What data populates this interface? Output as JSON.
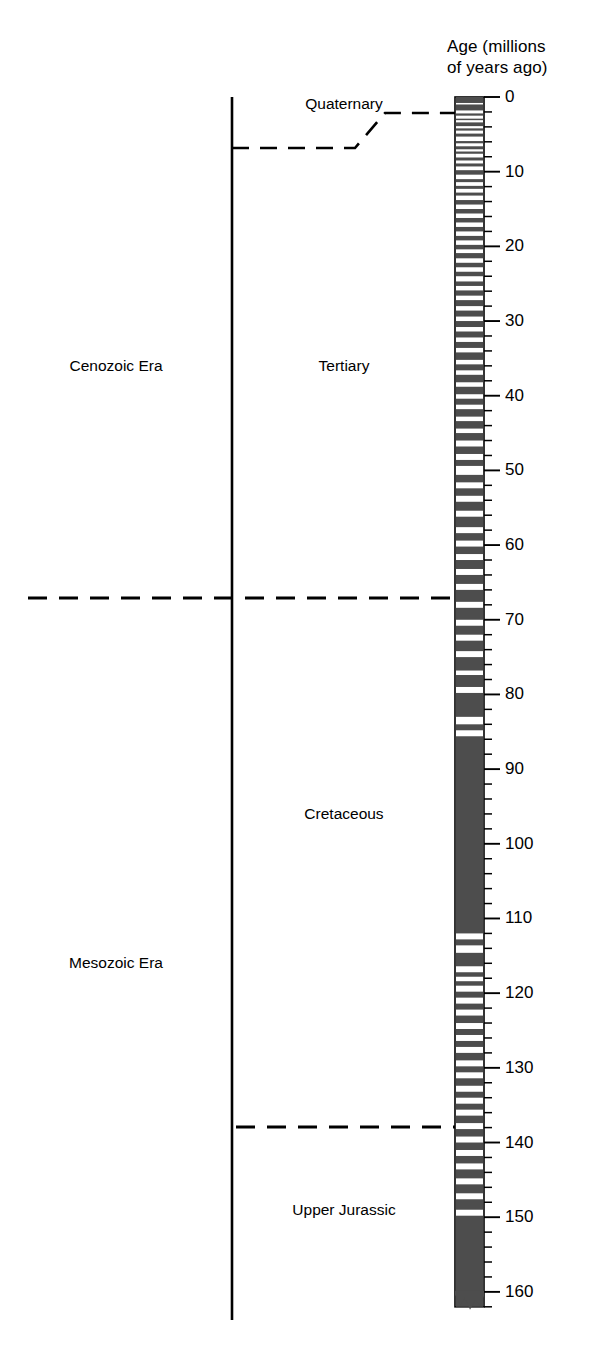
{
  "figure": {
    "axis_title": "Age (millions\nof years ago)",
    "axis_title_line1": "Age (millions",
    "axis_title_line2": "of years ago)"
  },
  "colors": {
    "normal_polarity": "#4d4d4d",
    "reversed_polarity": "#ffffff",
    "line": "#000000",
    "background": "#ffffff"
  },
  "chart_data": {
    "type": "bar",
    "subtitle": "",
    "xlabel": "",
    "ylabel": "Age (millions of years ago)",
    "ylim": [
      0,
      162
    ],
    "grid": false,
    "legend": "none",
    "orientation": "vertical-inverted",
    "axis": {
      "major_tick_interval": 10,
      "minor_tick_interval": 2,
      "tick_labels": [
        "0",
        "10",
        "20",
        "30",
        "40",
        "50",
        "60",
        "70",
        "80",
        "90",
        "100",
        "110",
        "120",
        "130",
        "140",
        "150",
        "160"
      ],
      "tick_values": [
        0,
        10,
        20,
        30,
        40,
        50,
        60,
        70,
        80,
        90,
        100,
        110,
        120,
        130,
        140,
        150,
        160
      ]
    },
    "units": "millions of years ago",
    "categories": [
      "Cenozoic Era",
      "Mesozoic Era"
    ],
    "eras": [
      {
        "label": "Cenozoic Era",
        "start": 0,
        "end": 66,
        "label_at": 36
      },
      {
        "label": "Mesozoic Era",
        "start": 66,
        "end": 162,
        "label_at": 116
      }
    ],
    "periods": [
      {
        "label": "Quaternary",
        "start": 0,
        "end": 1.8,
        "label_at": 1.0
      },
      {
        "label": "Tertiary",
        "start": 1.8,
        "end": 66,
        "label_at": 36
      },
      {
        "label": "Cretaceous",
        "start": 66,
        "end": 138,
        "label_at": 96
      },
      {
        "label": "Upper Jurassic",
        "start": 138,
        "end": 162,
        "label_at": 149
      }
    ],
    "boundaries": [
      {
        "name": "quaternary-tertiary",
        "age": 1.8,
        "style": "dashed-stepped",
        "span": "period-column"
      },
      {
        "name": "cenozoic-mesozoic",
        "age": 66,
        "style": "dashed",
        "span": "full-width"
      },
      {
        "name": "cretaceous-jurassic",
        "age": 138,
        "style": "dashed",
        "span": "period-column"
      }
    ],
    "polarity_column": {
      "description": "Magnetic polarity stripes: dark = normal polarity, white = reversed polarity",
      "top_age": 0,
      "bottom_age": 162,
      "normal_polarity_intervals": [
        [
          0.0,
          0.8
        ],
        [
          1.0,
          1.8
        ],
        [
          2.2,
          2.5
        ],
        [
          2.9,
          3.1
        ],
        [
          3.4,
          3.9
        ],
        [
          4.2,
          4.5
        ],
        [
          4.9,
          5.3
        ],
        [
          5.9,
          6.2
        ],
        [
          6.6,
          7.0
        ],
        [
          7.3,
          7.6
        ],
        [
          8.1,
          8.5
        ],
        [
          8.9,
          9.3
        ],
        [
          9.8,
          10.4
        ],
        [
          11.0,
          11.4
        ],
        [
          11.9,
          12.3
        ],
        [
          12.8,
          13.2
        ],
        [
          13.8,
          14.4
        ],
        [
          15.0,
          15.6
        ],
        [
          16.2,
          16.8
        ],
        [
          17.4,
          18.0
        ],
        [
          18.6,
          19.2
        ],
        [
          19.8,
          20.4
        ],
        [
          20.9,
          21.6
        ],
        [
          22.2,
          22.8
        ],
        [
          23.4,
          24.0
        ],
        [
          24.7,
          25.3
        ],
        [
          25.9,
          26.6
        ],
        [
          27.2,
          28.0
        ],
        [
          28.6,
          29.4
        ],
        [
          30.0,
          30.8
        ],
        [
          31.4,
          32.2
        ],
        [
          32.8,
          33.6
        ],
        [
          34.2,
          35.2
        ],
        [
          35.8,
          36.6
        ],
        [
          37.2,
          38.2
        ],
        [
          38.8,
          39.8
        ],
        [
          40.4,
          41.2
        ],
        [
          41.8,
          42.8
        ],
        [
          43.4,
          44.4
        ],
        [
          45.0,
          46.0
        ],
        [
          46.8,
          47.8
        ],
        [
          48.6,
          49.4
        ],
        [
          50.6,
          51.6
        ],
        [
          52.4,
          53.4
        ],
        [
          54.2,
          55.4
        ],
        [
          56.2,
          57.6
        ],
        [
          58.4,
          59.4
        ],
        [
          60.2,
          61.2
        ],
        [
          62.0,
          63.2
        ],
        [
          64.0,
          65.2
        ],
        [
          66.0,
          67.6
        ],
        [
          68.4,
          70.0
        ],
        [
          70.8,
          72.0
        ],
        [
          72.8,
          74.2
        ],
        [
          75.0,
          76.8
        ],
        [
          77.4,
          79.0
        ],
        [
          79.8,
          83.0
        ],
        [
          84.0,
          84.8
        ],
        [
          85.6,
          112.0
        ],
        [
          112.8,
          113.6
        ],
        [
          114.6,
          116.4
        ],
        [
          117.2,
          117.8
        ],
        [
          118.4,
          119.0
        ],
        [
          119.8,
          120.6
        ],
        [
          121.4,
          122.2
        ],
        [
          123.0,
          124.0
        ],
        [
          124.8,
          125.6
        ],
        [
          126.4,
          127.2
        ],
        [
          128.0,
          129.0
        ],
        [
          129.8,
          130.6
        ],
        [
          131.4,
          132.4
        ],
        [
          133.2,
          134.0
        ],
        [
          134.8,
          135.6
        ],
        [
          136.4,
          137.4
        ],
        [
          138.2,
          139.2
        ],
        [
          140.0,
          141.0
        ],
        [
          141.8,
          142.8
        ],
        [
          143.6,
          144.8
        ],
        [
          145.6,
          146.8
        ],
        [
          147.6,
          149.0
        ],
        [
          149.8,
          162.0
        ]
      ]
    }
  }
}
